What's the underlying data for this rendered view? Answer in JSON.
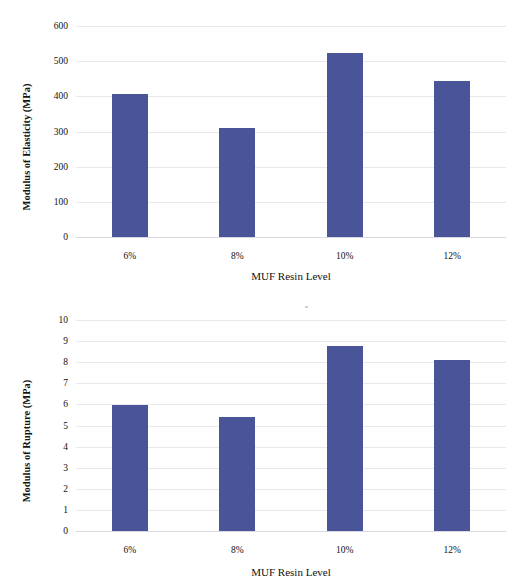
{
  "chart_data": [
    {
      "type": "bar",
      "title": "",
      "xlabel": "MUF Resin Level",
      "ylabel": "Modulus of Elasticity (MPa)",
      "categories": [
        "6%",
        "8%",
        "10%",
        "12%"
      ],
      "values": [
        406,
        311,
        522,
        443
      ],
      "ylim": [
        0,
        600
      ],
      "yticks": [
        0,
        100,
        200,
        300,
        400,
        500,
        600
      ],
      "ytick_labels": [
        "0",
        "100",
        "200",
        "300",
        "400",
        "500",
        "600"
      ],
      "grid": true,
      "legend": "none",
      "bar_color": "#4a5499"
    },
    {
      "type": "bar",
      "title": "",
      "xlabel": "MUF Resin Level",
      "ylabel": "Modulus of Rupture (MPa)",
      "categories": [
        "6%",
        "8%",
        "10%",
        "12%"
      ],
      "values": [
        5.95,
        5.4,
        8.75,
        8.1
      ],
      "ylim": [
        0,
        10
      ],
      "yticks": [
        0,
        1,
        2,
        3,
        4,
        5,
        6,
        7,
        8,
        9,
        10
      ],
      "ytick_labels": [
        "0",
        "1",
        "2",
        "3",
        "4",
        "5",
        "6",
        "7",
        "8",
        "9",
        "10"
      ],
      "grid": true,
      "legend": "none",
      "bar_color": "#4a5499"
    }
  ]
}
